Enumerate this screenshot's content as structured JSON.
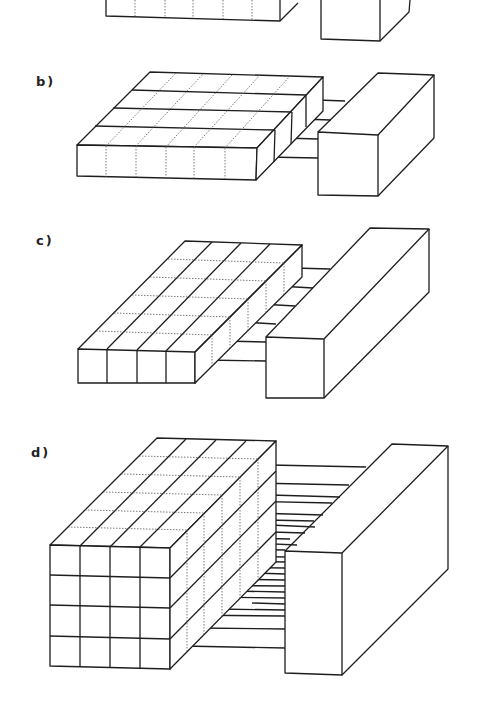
{
  "figure": {
    "panels": [
      {
        "id": "a",
        "label": "",
        "note": "cropped at top; left block with dotted vertical divisions and right box"
      },
      {
        "id": "b",
        "label": "b)",
        "partitions": "4 horizontal slabs along depth",
        "connections": 4
      },
      {
        "id": "c",
        "label": "c)",
        "partitions": "4 columns along width, 6 rows along depth",
        "connections": 6
      },
      {
        "id": "d",
        "label": "d)",
        "partitions": "4x4 grid front face, 6 rows along depth",
        "connections": 24
      }
    ],
    "colors": {
      "line": "#1e1e1e",
      "background": "#ffffff"
    }
  }
}
